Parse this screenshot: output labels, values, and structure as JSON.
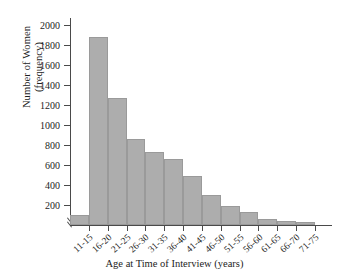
{
  "chart_data": {
    "type": "bar",
    "title": "",
    "xlabel": "Age at Time of Interview (years)",
    "ylabel": "Number of Women (frequency)",
    "ylabel_lines": [
      "Number of Women",
      "(frequency)"
    ],
    "categories": [
      "11-15",
      "16-20",
      "21-25",
      "26-30",
      "31-35",
      "36-40",
      "41-45",
      "46-50",
      "51-55",
      "56-60",
      "61-65",
      "66-70",
      "71-75"
    ],
    "values": [
      100,
      1880,
      1270,
      860,
      730,
      660,
      490,
      300,
      190,
      135,
      65,
      45,
      35
    ],
    "ylim": [
      0,
      2000
    ],
    "yticks": [
      200,
      400,
      600,
      800,
      1000,
      1200,
      1400,
      1600,
      1800,
      2000
    ],
    "ytick_labels": [
      "200",
      "400",
      "600",
      "800",
      "1000",
      "1200",
      "1400",
      "1600",
      "1800",
      "2000"
    ],
    "grid": false,
    "legend": null,
    "bar_color": "#adadad",
    "bar_edge_color": "#9a9a9a",
    "axis_color": "#4a4a4a",
    "axis_break_y": true
  }
}
